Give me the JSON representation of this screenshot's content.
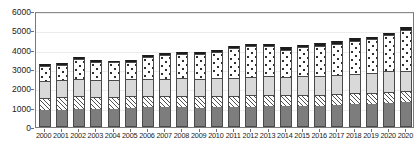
{
  "chart_data": {
    "type": "bar",
    "title": "",
    "subtitle": "",
    "xlabel": "",
    "ylabel": "",
    "stacked": true,
    "grid": true,
    "legend_position": "none",
    "ylim": [
      0,
      6000
    ],
    "ytick_step": 1000,
    "yticks": [
      "0",
      "1000",
      "2000",
      "3000",
      "4000",
      "5000",
      "6000"
    ],
    "categories": [
      "2000",
      "2001",
      "2002",
      "2003",
      "2004",
      "2005",
      "2006",
      "2007",
      "2008",
      "2009",
      "2010",
      "2011",
      "2012",
      "2013",
      "2014",
      "2015",
      "2016",
      "2017",
      "2018",
      "2019",
      "2020",
      "2020"
    ],
    "series": [
      {
        "name": "segment-1-dark-gray",
        "pattern": "solid-dark-gray",
        "color": "#7d7d7d",
        "values": [
          880,
          900,
          940,
          930,
          940,
          1000,
          1020,
          1010,
          1020,
          1000,
          1020,
          1040,
          1060,
          1080,
          1070,
          1090,
          1100,
          1120,
          1180,
          1200,
          1260,
          1280
        ]
      },
      {
        "name": "segment-2-hatched",
        "pattern": "diagonal-hatch",
        "color": "#4f4f4f",
        "values": [
          620,
          630,
          640,
          640,
          620,
          600,
          600,
          590,
          600,
          580,
          580,
          590,
          590,
          600,
          590,
          590,
          580,
          590,
          580,
          580,
          560,
          560
        ]
      },
      {
        "name": "segment-3-light-gray",
        "pattern": "solid-light-gray",
        "color": "#d9d9d9",
        "values": [
          880,
          880,
          900,
          880,
          880,
          860,
          880,
          880,
          900,
          900,
          920,
          920,
          940,
          950,
          950,
          960,
          970,
          980,
          1000,
          1020,
          1060,
          1080
        ]
      },
      {
        "name": "segment-4-dotted",
        "pattern": "dotted-white",
        "color": "#ffffff",
        "values": [
          780,
          800,
          1020,
          900,
          900,
          920,
          1100,
          1240,
          1250,
          1290,
          1340,
          1520,
          1580,
          1560,
          1400,
          1480,
          1560,
          1620,
          1700,
          1740,
          1880,
          2120
        ]
      },
      {
        "name": "segment-5-black-cap",
        "pattern": "solid-black",
        "color": "#1c1c1c",
        "values": [
          90,
          90,
          100,
          100,
          100,
          100,
          110,
          110,
          110,
          110,
          120,
          120,
          120,
          120,
          110,
          110,
          120,
          120,
          120,
          120,
          130,
          130
        ]
      }
    ],
    "totals": [
      3250,
      3300,
      3600,
      3450,
      3440,
      3480,
      3710,
      3830,
      3880,
      3880,
      3980,
      4190,
      4290,
      4310,
      4120,
      4230,
      4330,
      4430,
      4580,
      4660,
      4890,
      5170
    ]
  }
}
